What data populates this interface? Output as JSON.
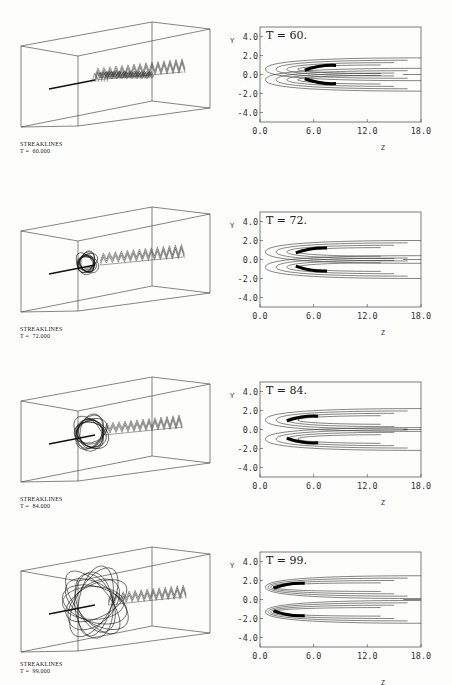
{
  "figure": {
    "panels": [
      {
        "streak_title": "STREAKLINES",
        "streak_time": "T =  60.000",
        "contour_label": "T = 60.",
        "top": 0,
        "bubble_r": 0,
        "contour_x_label_y": 150,
        "y_axis_label": "Y"
      },
      {
        "streak_title": "STREAKLINES",
        "streak_time": "T =  72.000",
        "contour_label": "T = 72.",
        "top": 185,
        "bubble_r": 9,
        "contour_x_label_y": 150,
        "y_axis_label": "Y"
      },
      {
        "streak_title": "STREAKLINES",
        "streak_time": "T =  84.000",
        "contour_label": "T = 84.",
        "top": 355,
        "bubble_r": 15,
        "contour_x_label_y": 150,
        "y_axis_label": "Y"
      },
      {
        "streak_title": "STREAKLINES",
        "streak_time": "T =  99.000",
        "contour_label": "T = 99.",
        "top": 525,
        "bubble_r": 22,
        "contour_x_label_y": 160,
        "y_axis_label": "Y"
      }
    ],
    "axes": {
      "y_ticks": [
        "4.0",
        "2.0",
        "0.0",
        "-2.0",
        "-4.0"
      ],
      "x_ticks": [
        "0.0",
        "6.0",
        "12.0",
        "18.0"
      ],
      "x_label": "Z",
      "y_label": "Y"
    }
  },
  "chart_data": [
    {
      "type": "heatmap",
      "title": "T = 60.",
      "xlabel": "Z",
      "ylabel": "Y",
      "xlim": [
        0.0,
        18.0
      ],
      "ylim": [
        -4.0,
        4.0
      ],
      "x_ticks": [
        0.0,
        6.0,
        12.0,
        18.0
      ],
      "y_ticks": [
        4.0,
        2.0,
        0.0,
        -2.0,
        -4.0
      ],
      "description": "Contour lines of a wake/vortex field; concentration peak near Z=6-8, Y=±0.5, contours extend to Z=18 within |Y|<2"
    },
    {
      "type": "heatmap",
      "title": "T = 72.",
      "xlabel": "Z",
      "ylabel": "Y",
      "xlim": [
        0.0,
        18.0
      ],
      "ylim": [
        -4.0,
        4.0
      ],
      "x_ticks": [
        0.0,
        6.0,
        12.0,
        18.0
      ],
      "y_ticks": [
        4.0,
        2.0,
        0.0,
        -2.0,
        -4.0
      ],
      "description": "Contour peak near Z=5-7, Y=±1"
    },
    {
      "type": "heatmap",
      "title": "T = 84.",
      "xlabel": "Z",
      "ylabel": "Y",
      "xlim": [
        0.0,
        18.0
      ],
      "ylim": [
        -4.0,
        4.0
      ],
      "x_ticks": [
        0.0,
        6.0,
        12.0,
        18.0
      ],
      "y_ticks": [
        4.0,
        2.0,
        0.0,
        -2.0,
        -4.0
      ],
      "description": "Contour peak near Z=4-7, Y=±1.2, V-shaped pattern"
    },
    {
      "type": "heatmap",
      "title": "T = 99.",
      "xlabel": "Z",
      "ylabel": "Y",
      "xlim": [
        0.0,
        18.0
      ],
      "ylim": [
        -4.0,
        4.0
      ],
      "x_ticks": [
        0.0,
        6.0,
        12.0,
        18.0
      ],
      "y_ticks": [
        4.0,
        2.0,
        0.0,
        -2.0,
        -4.0
      ],
      "description": "Contour peak near Z=1-6, Y=±1.5, bubble-shaped recirculation region"
    }
  ]
}
